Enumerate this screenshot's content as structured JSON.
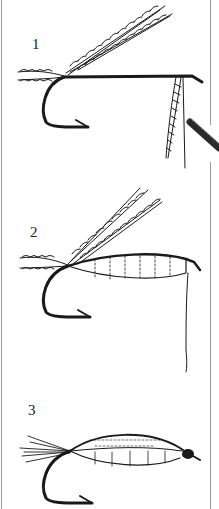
{
  "illustration": {
    "subject": "fly tying steps",
    "steps": [
      {
        "label": "1"
      },
      {
        "label": "2"
      },
      {
        "label": "3"
      }
    ],
    "colors": {
      "ink": "#1a1a1a",
      "background": "#ffffff",
      "border": "#9a9a9a"
    }
  }
}
